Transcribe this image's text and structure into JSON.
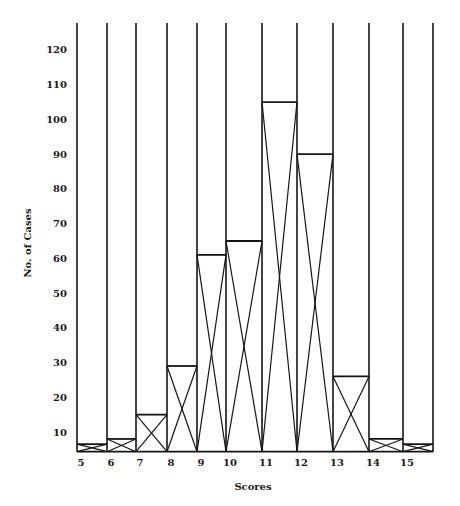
{
  "chart_data": {
    "type": "bar",
    "style": "histogram with X-crossed bars and full-height column dividers",
    "title": "",
    "xlabel": "Scores",
    "ylabel": "No. of Cases",
    "categories": [
      "5",
      "6",
      "7",
      "8",
      "9",
      "10",
      "11",
      "12",
      "13",
      "14",
      "15"
    ],
    "values": [
      6.5,
      8,
      15,
      29,
      61,
      65,
      105,
      90,
      26,
      8,
      6.5
    ],
    "y_ticks": [
      10,
      20,
      30,
      40,
      50,
      60,
      70,
      80,
      90,
      100,
      110,
      120
    ],
    "ylim": [
      4,
      128
    ],
    "grid": false,
    "legend": null,
    "colors": {
      "line": "#151515",
      "background": "#ffffff",
      "text": "#1a1a1a"
    }
  },
  "layout": {
    "column_edges_x": [
      77,
      107,
      136,
      167,
      197,
      226,
      262,
      297,
      333,
      369,
      403,
      433
    ],
    "column_top_y": 23,
    "baseline_y": 451.7,
    "ref_value": 10,
    "ref_y": 432,
    "px_per_unit": 3.473,
    "y_tick_label_x": 67,
    "x_tick_label_y": 466,
    "xlabel_pos": [
      253,
      490
    ],
    "ylabel_pos": [
      31,
      243
    ]
  }
}
